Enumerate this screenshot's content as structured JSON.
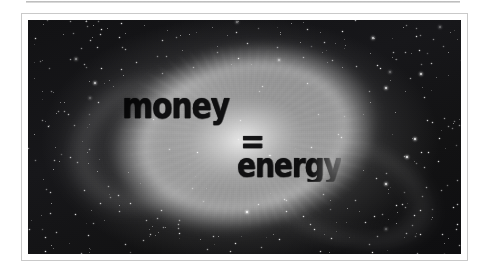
{
  "page": {
    "background_color": "#ffffff",
    "top_rule_color": "#b4b4b4"
  },
  "photo": {
    "frame_border_color": "#c9c9c9",
    "mat_color": "#ffffff",
    "subject": "helix-nebula-starfield",
    "palette": {
      "deep_space": "#121214",
      "nebula_core": "#e1e1e1",
      "nebula_ring": "#cdcdcd",
      "star": "#ffffff"
    }
  },
  "caption": {
    "text_color": "#08080a",
    "line1": "money",
    "operator": "=",
    "line2": "energy",
    "full_text": "money = energy"
  }
}
